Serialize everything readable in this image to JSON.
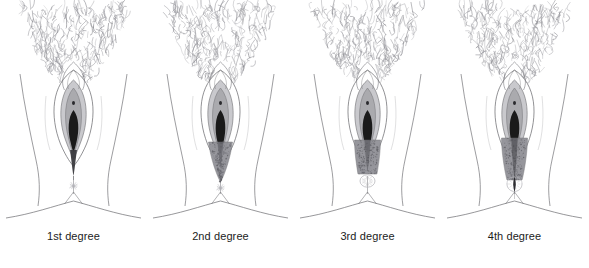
{
  "figure": {
    "background_color": "#ffffff",
    "panel_count": 4
  },
  "style": {
    "line_color": "#6e6e72",
    "hair_color": "#8d8d93",
    "skin_fill": "#ffffff",
    "labia_minora_fill": "#a9a9ad",
    "vestibule_fill": "#c9c9cd",
    "introitus_fill": "#1a1a1a",
    "tear_fill": "#8f8f95",
    "tear_stipple": "#5d5d63",
    "anus_color": "#b4b4b9",
    "label_color": "#1c1c1c"
  },
  "panels": [
    {
      "id": "first-degree",
      "label": "1st degree",
      "tear": {
        "extent": "vaginal mucosa and perineal skin only",
        "shape": "narrow-sliver",
        "length": 58,
        "max_width": 7,
        "reaches_anus": false,
        "involves_sphincter": false,
        "through_anal_mucosa": false
      },
      "anus": {
        "state": "intact",
        "style": "starburst"
      }
    },
    {
      "id": "second-degree",
      "label": "2nd degree",
      "tear": {
        "extent": "extends into perineal muscles",
        "shape": "tapered-triangle",
        "length": 62,
        "max_width": 24,
        "reaches_anus": false,
        "involves_sphincter": false,
        "through_anal_mucosa": false
      },
      "anus": {
        "state": "intact",
        "style": "starburst"
      }
    },
    {
      "id": "third-degree",
      "label": "3rd degree",
      "tear": {
        "extent": "extends to the anal sphincter",
        "shape": "blunt-band",
        "length": 56,
        "max_width": 26,
        "reaches_anus": true,
        "involves_sphincter": true,
        "through_anal_mucosa": false
      },
      "anus": {
        "state": "sphincter-involved",
        "style": "open-ring"
      }
    },
    {
      "id": "fourth-degree",
      "label": "4th degree",
      "tear": {
        "extent": "extends through the anal sphincter and rectal mucosa",
        "shape": "long-band-through-anus",
        "length": 78,
        "max_width": 26,
        "reaches_anus": true,
        "involves_sphincter": true,
        "through_anal_mucosa": true
      },
      "anus": {
        "state": "torn-through",
        "style": "split-ring"
      }
    }
  ]
}
